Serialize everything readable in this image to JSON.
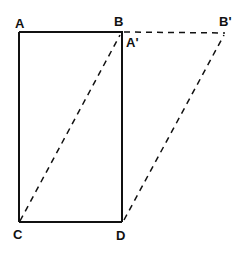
{
  "diagram": {
    "labels": {
      "A": "A",
      "B": "B",
      "A_prime": "A'",
      "B_prime": "B'",
      "C": "C",
      "D": "D"
    },
    "edges": [
      {
        "from": "A",
        "to": "B",
        "style": "solid"
      },
      {
        "from": "A",
        "to": "C",
        "style": "solid"
      },
      {
        "from": "B",
        "to": "D",
        "style": "solid"
      },
      {
        "from": "C",
        "to": "D",
        "style": "solid"
      },
      {
        "from": "B",
        "to": "B'",
        "style": "dashed"
      },
      {
        "from": "C",
        "to": "A'",
        "style": "dashed"
      },
      {
        "from": "D",
        "to": "B'",
        "style": "dashed"
      }
    ],
    "colors": {
      "line": "#111111",
      "background": "#ffffff"
    }
  }
}
